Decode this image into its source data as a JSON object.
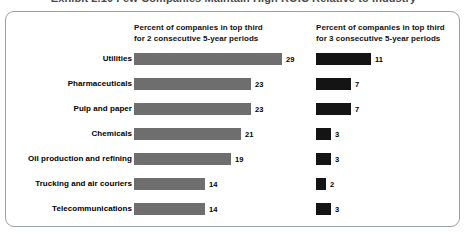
{
  "clipped_title": "Exhibit 2.10   Few Companies Maintain High ROIC Relative to Industry",
  "headers": {
    "left": "Percent of companies in top third\nfor 2 consecutive 5-year periods",
    "right": "Percent of companies in top third\nfor 3 consecutive 5-year periods"
  },
  "colors": {
    "bar_left": "#6e6e6e",
    "bar_right": "#141414",
    "frame_border": "#9aa0a6",
    "background": "#ffffff"
  },
  "chart_data": {
    "type": "bar",
    "title": "Exhibit 2.10   Few Companies Maintain High ROIC Relative to Industry",
    "xlabel": "",
    "ylabel": "",
    "xlim": [
      0,
      29
    ],
    "grid": false,
    "legend_position": "none",
    "orientation": "horizontal",
    "categories": [
      "Utilities",
      "Pharmaceuticals",
      "Pulp and paper",
      "Chemicals",
      "Oil production and refining",
      "Trucking and air couriers",
      "Telecommunications"
    ],
    "series": [
      {
        "name": "Percent of companies in top third for 2 consecutive 5-year periods",
        "values": [
          29,
          23,
          23,
          21,
          19,
          14,
          14
        ]
      },
      {
        "name": "Percent of companies in top third for 3 consecutive 5-year periods",
        "values": [
          11,
          7,
          7,
          3,
          3,
          2,
          3
        ]
      }
    ]
  }
}
